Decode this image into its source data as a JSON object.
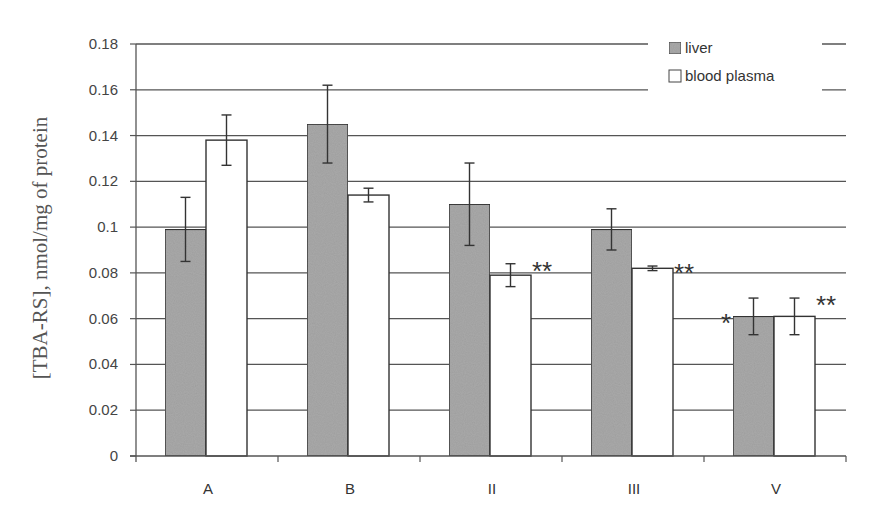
{
  "chart_data": {
    "type": "bar",
    "title": "",
    "xlabel": "",
    "ylabel": "[TBA-RS], nmol/mg of protein",
    "ylim": [
      0,
      0.18
    ],
    "yticks": [
      0,
      0.02,
      0.04,
      0.06,
      0.08,
      0.1,
      0.12,
      0.14,
      0.16,
      0.18
    ],
    "ytick_labels": [
      "0",
      "0.02",
      "0.04",
      "0.06",
      "0.08",
      "0.1",
      "0.12",
      "0.14",
      "0.16",
      "0.18"
    ],
    "grid": true,
    "legend_position": "top-right",
    "categories": [
      "A",
      "B",
      "II",
      "III",
      "V"
    ],
    "series": [
      {
        "name": "liver",
        "color": "#a9a9a9",
        "values": [
          0.099,
          0.145,
          0.11,
          0.099,
          0.061
        ],
        "error_low": [
          0.085,
          0.128,
          0.092,
          0.09,
          0.053
        ],
        "error_high": [
          0.113,
          0.162,
          0.128,
          0.108,
          0.069
        ],
        "annotations": [
          "",
          "",
          "",
          "",
          "*"
        ]
      },
      {
        "name": "blood plasma",
        "color": "#ffffff",
        "values": [
          0.138,
          0.114,
          0.079,
          0.082,
          0.061
        ],
        "error_low": [
          0.127,
          0.111,
          0.074,
          0.081,
          0.053
        ],
        "error_high": [
          0.149,
          0.117,
          0.084,
          0.083,
          0.069
        ],
        "annotations": [
          "",
          "",
          "**",
          "**",
          "**"
        ]
      }
    ]
  }
}
